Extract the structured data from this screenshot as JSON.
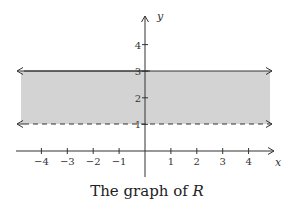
{
  "chart_data": {
    "type": "region",
    "title": "",
    "caption": "The graph of R",
    "caption_prefix": "The graph of ",
    "caption_var": "R",
    "xlabel": "x",
    "ylabel": "y",
    "xlim": [
      -5,
      5
    ],
    "ylim": [
      -1,
      5
    ],
    "x_ticks": [
      "-4",
      "-3",
      "-2",
      "-1",
      "1",
      "2",
      "3",
      "4"
    ],
    "y_ticks": [
      "1",
      "2",
      "3",
      "4"
    ],
    "grid": false,
    "region": {
      "description": "Shaded horizontal strip 1 < y <= 3",
      "lower_bound": {
        "y": 1,
        "style": "dashed",
        "inclusive": false
      },
      "upper_bound": {
        "y": 3,
        "style": "solid",
        "inclusive": true
      },
      "fill_color": "#d3d3d3"
    }
  },
  "axes": {
    "x_label": "x",
    "y_label": "y",
    "tick_labels_x": [
      {
        "v": -4,
        "t": "−4"
      },
      {
        "v": -3,
        "t": "−3"
      },
      {
        "v": -2,
        "t": "−2"
      },
      {
        "v": -1,
        "t": "−1"
      },
      {
        "v": 1,
        "t": "1"
      },
      {
        "v": 2,
        "t": "2"
      },
      {
        "v": 3,
        "t": "3"
      },
      {
        "v": 4,
        "t": "4"
      }
    ],
    "tick_labels_y": [
      {
        "v": 1,
        "t": "1"
      },
      {
        "v": 2,
        "t": "2"
      },
      {
        "v": 3,
        "t": "3"
      },
      {
        "v": 4,
        "t": "4"
      }
    ]
  },
  "caption": {
    "prefix": "The graph of ",
    "var": "R"
  },
  "colors": {
    "fill": "#d3d3d3",
    "line": "#333333",
    "text": "#222222"
  }
}
